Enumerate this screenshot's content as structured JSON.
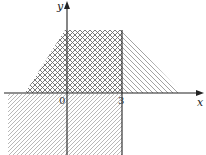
{
  "diagram": {
    "type": "region-graph",
    "axes": {
      "x_label": "x",
      "y_label": "y",
      "origin_label": "0",
      "tick_labels": [
        "3"
      ]
    },
    "regions": [
      {
        "name": "cross-hatched-trapezoid",
        "pattern": "crosshatch",
        "description": "Region above x-axis bounded by left diagonal, top line and x=3"
      },
      {
        "name": "right-triangle-hatched",
        "pattern": "diagonal",
        "description": "Triangle to the right of x=3 above x-axis"
      },
      {
        "name": "lower-hatched-band",
        "pattern": "diagonal",
        "description": "Region below x-axis, left of x=3"
      }
    ],
    "colors": {
      "axis": "#222222",
      "hatch": "#888888",
      "crosshatch": "#666666"
    }
  }
}
